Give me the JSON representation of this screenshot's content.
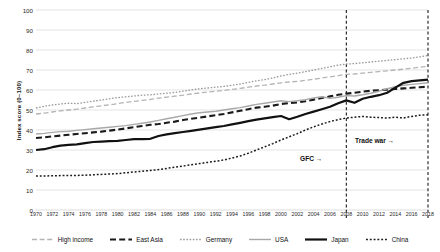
{
  "chart_data": {
    "type": "line",
    "title": "",
    "xlabel": "",
    "ylabel": "Index score (0–100)",
    "ylim": [
      0,
      100
    ],
    "ytick_step": 10,
    "yticks": [
      0,
      10,
      20,
      30,
      40,
      50,
      60,
      70,
      80,
      90,
      100
    ],
    "xlim": [
      1970,
      2018
    ],
    "x": [
      1970,
      1971,
      1972,
      1973,
      1974,
      1975,
      1976,
      1977,
      1978,
      1979,
      1980,
      1981,
      1982,
      1983,
      1984,
      1985,
      1986,
      1987,
      1988,
      1989,
      1990,
      1991,
      1992,
      1993,
      1994,
      1995,
      1996,
      1997,
      1998,
      1999,
      2000,
      2001,
      2002,
      2003,
      2004,
      2005,
      2006,
      2007,
      2008,
      2009,
      2010,
      2011,
      2012,
      2013,
      2014,
      2015,
      2016,
      2017,
      2018
    ],
    "xticks": [
      1970,
      1972,
      1974,
      1976,
      1978,
      1980,
      1982,
      1984,
      1986,
      1988,
      1990,
      1992,
      1994,
      1996,
      1998,
      2000,
      2002,
      2004,
      2006,
      2008,
      2010,
      2012,
      2014,
      2016,
      2018
    ],
    "grid": true,
    "legend_position": "bottom",
    "series": [
      {
        "name": "High income",
        "style": "dash-loose",
        "color": "#b4b4b4",
        "width": 1.3,
        "values": [
          48,
          48.4,
          49,
          49.6,
          50,
          50.4,
          51,
          51.6,
          52.1,
          52.6,
          53.2,
          53.8,
          54.3,
          54.8,
          55.3,
          55.9,
          56.4,
          56.9,
          57.4,
          58,
          58.5,
          59,
          59.4,
          59.8,
          60.3,
          60.8,
          61.4,
          62,
          62.4,
          63,
          63.6,
          64,
          64.3,
          64.8,
          65.4,
          66,
          66.6,
          67.2,
          67.8,
          68,
          68.4,
          68.8,
          69.2,
          69.6,
          70,
          70.4,
          70.9,
          71.4,
          71.8
        ]
      },
      {
        "name": "East Asia",
        "style": "dash-bold",
        "color": "#1a1a1a",
        "width": 2.1,
        "values": [
          36,
          36.3,
          36.8,
          37.2,
          37.6,
          38,
          38.4,
          38.8,
          39.2,
          39.7,
          40.2,
          40.8,
          41.4,
          42,
          42.6,
          43,
          43.6,
          44.2,
          45,
          45.6,
          46.2,
          46.8,
          47.4,
          48,
          48.8,
          49.6,
          50.4,
          51.2,
          51.6,
          52.2,
          53,
          53.4,
          53.8,
          54.4,
          55.2,
          56,
          56.8,
          57.6,
          58.2,
          58.6,
          59.2,
          59.6,
          59.9,
          60.2,
          60.5,
          60.8,
          61.1,
          61.4,
          61.7
        ]
      },
      {
        "name": "Germany",
        "style": "dot-fine",
        "color": "#9a9a9a",
        "width": 1.3,
        "values": [
          51,
          51.8,
          52.5,
          53,
          53.4,
          53.2,
          53.8,
          54.4,
          55,
          55.6,
          56.2,
          56.6,
          57,
          57.4,
          57.6,
          58,
          58.4,
          58.8,
          59.4,
          60,
          60.6,
          61,
          61.4,
          61.8,
          62.4,
          63,
          63.8,
          64.6,
          65.2,
          66,
          67,
          67.8,
          68.4,
          69.2,
          70,
          70.8,
          71.6,
          72.4,
          73,
          73.2,
          73.6,
          74,
          74.4,
          74.8,
          75.2,
          75.6,
          76,
          76.6,
          77.2
        ]
      },
      {
        "name": "USA",
        "style": "solid-thin",
        "color": "#a8a8a8",
        "width": 1.4,
        "values": [
          38,
          38.3,
          38.8,
          39.2,
          39.4,
          39.8,
          40.2,
          40.6,
          41,
          41.4,
          41.8,
          42.2,
          42.8,
          43.4,
          44,
          44.8,
          45.6,
          46.4,
          47.2,
          48,
          48.6,
          49,
          49.4,
          50,
          50.6,
          51.2,
          52,
          52.8,
          53.4,
          54,
          54.6,
          54.2,
          54.6,
          55.2,
          56,
          56.6,
          55.8,
          56.4,
          57.2,
          57,
          57.6,
          58.4,
          59.4,
          60.6,
          61.6,
          62.4,
          62.8,
          63.2,
          63.6
        ]
      },
      {
        "name": "Japan",
        "style": "solid-bold",
        "color": "#111111",
        "width": 2.2,
        "values": [
          30,
          30.4,
          31.4,
          32.2,
          32.6,
          32.8,
          33.4,
          34,
          34.2,
          34.4,
          34.6,
          35,
          35.4,
          35.4,
          35.6,
          37,
          37.8,
          38.4,
          39,
          39.6,
          40.2,
          40.8,
          41.4,
          42,
          42.8,
          43.6,
          44.4,
          45.2,
          45.8,
          46.4,
          47,
          45.4,
          46.6,
          48,
          49.2,
          50.4,
          51.6,
          53.4,
          54.8,
          53.6,
          55.6,
          56.6,
          57.4,
          58.6,
          61.2,
          63.6,
          64.4,
          64.8,
          65.2
        ]
      },
      {
        "name": "China",
        "style": "dot-coarse",
        "color": "#1a1a1a",
        "width": 1.5,
        "values": [
          17,
          17,
          17.1,
          17.2,
          17.2,
          17.3,
          17.4,
          17.6,
          17.8,
          18,
          18.2,
          18.6,
          19,
          19.4,
          19.8,
          20.2,
          20.8,
          21.4,
          22,
          22.6,
          23.2,
          23.8,
          24.4,
          25,
          26,
          27,
          28.4,
          30,
          31.6,
          33.2,
          35,
          36.6,
          38.2,
          40,
          41.6,
          43,
          44.2,
          45.2,
          46,
          46.4,
          46.8,
          46.4,
          46.2,
          46,
          46.4,
          46,
          46.8,
          47.4,
          47.6
        ]
      }
    ],
    "vlines": [
      {
        "x": 2008,
        "label": "GFC →"
      },
      {
        "x": 2018,
        "label": "Trade war →"
      }
    ]
  },
  "annotations": {
    "gfc": "GFC →",
    "trade_war": "Trade war →"
  },
  "axis": {
    "y_title": "Index score (0–100)"
  }
}
